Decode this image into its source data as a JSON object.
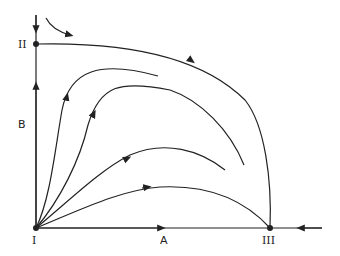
{
  "diagram": {
    "type": "phase-plane",
    "axes": {
      "x_label": "A",
      "y_label": "B"
    },
    "fixed_points": [
      {
        "id": "I",
        "label": "I",
        "position": "origin"
      },
      {
        "id": "II",
        "label": "II",
        "position": "on B axis (top)"
      },
      {
        "id": "III",
        "label": "III",
        "position": "on A axis (right)"
      }
    ],
    "trajectories": [
      "Separatrix from II to III (arrow pointing right/down)",
      "Four trajectories emanating from I curving upward then right",
      "Trajectory along A axis from I toward III",
      "Trajectory along A axis from right toward III",
      "Trajectory along B axis from I toward II and from above toward II",
      "Curved arrow near top-left"
    ],
    "colors": {
      "line": "#222222",
      "background": "#ffffff"
    }
  }
}
